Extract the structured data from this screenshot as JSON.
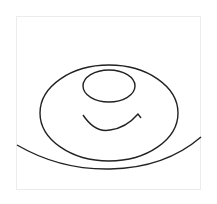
{
  "drawing": {
    "description": "Hand-drawn sketch: large ellipse containing small oval and smile arc, with sweeping arc below",
    "stroke_color": "#222222",
    "background": "#ffffff",
    "frame_border_color": "#ececec"
  }
}
